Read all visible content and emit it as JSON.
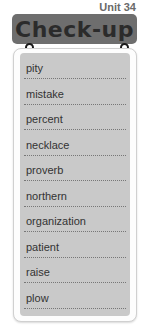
{
  "unit_label": "Unit 34",
  "header": {
    "title": "Check-up"
  },
  "words": [
    "pity",
    "mistake",
    "percent",
    "necklace",
    "proverb",
    "northern",
    "organization",
    "patient",
    "raise",
    "plow"
  ],
  "colors": {
    "header_bg": "#6e6e6e",
    "panel_bg": "#c9c9c9"
  }
}
